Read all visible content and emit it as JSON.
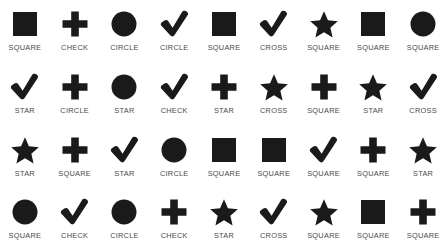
{
  "grid": {
    "columns": 9,
    "rows": 4,
    "shape_color": "#1a1a1a",
    "label_color": "#4a4a4a",
    "background_color": "#ffffff",
    "cells": [
      {
        "icon": "square-icon",
        "label": "SQUARE"
      },
      {
        "icon": "cross-icon",
        "label": "CHECK"
      },
      {
        "icon": "circle-icon",
        "label": "CIRCLE"
      },
      {
        "icon": "check-icon",
        "label": "CIRCLE"
      },
      {
        "icon": "square-icon",
        "label": "SQUARE"
      },
      {
        "icon": "check-icon",
        "label": "CROSS"
      },
      {
        "icon": "star-icon",
        "label": "SQUARE"
      },
      {
        "icon": "square-icon",
        "label": "SQUARE"
      },
      {
        "icon": "circle-icon",
        "label": "SQUARE"
      },
      {
        "icon": "check-icon",
        "label": "STAR"
      },
      {
        "icon": "cross-icon",
        "label": "CIRCLE"
      },
      {
        "icon": "circle-icon",
        "label": "STAR"
      },
      {
        "icon": "check-icon",
        "label": "CHECK"
      },
      {
        "icon": "cross-icon",
        "label": "STAR"
      },
      {
        "icon": "star-icon",
        "label": "CROSS"
      },
      {
        "icon": "cross-icon",
        "label": "SQUARE"
      },
      {
        "icon": "star-icon",
        "label": "STAR"
      },
      {
        "icon": "check-icon",
        "label": "CROSS"
      },
      {
        "icon": "star-icon",
        "label": "STAR"
      },
      {
        "icon": "cross-icon",
        "label": "SQUARE"
      },
      {
        "icon": "check-icon",
        "label": "STAR"
      },
      {
        "icon": "circle-icon",
        "label": "CIRCLE"
      },
      {
        "icon": "square-icon",
        "label": "SQUARE"
      },
      {
        "icon": "square-icon",
        "label": "SQUARE"
      },
      {
        "icon": "check-icon",
        "label": "SQUARE"
      },
      {
        "icon": "cross-icon",
        "label": "SQUARE"
      },
      {
        "icon": "star-icon",
        "label": "STAR"
      },
      {
        "icon": "circle-icon",
        "label": "SQUARE"
      },
      {
        "icon": "check-icon",
        "label": "CHECK"
      },
      {
        "icon": "circle-icon",
        "label": "CIRCLE"
      },
      {
        "icon": "cross-icon",
        "label": "CHECK"
      },
      {
        "icon": "star-icon",
        "label": "STAR"
      },
      {
        "icon": "check-icon",
        "label": "CROSS"
      },
      {
        "icon": "star-icon",
        "label": "SQUARE"
      },
      {
        "icon": "square-icon",
        "label": "SQUARE"
      },
      {
        "icon": "cross-icon",
        "label": "SQUARE"
      }
    ]
  }
}
